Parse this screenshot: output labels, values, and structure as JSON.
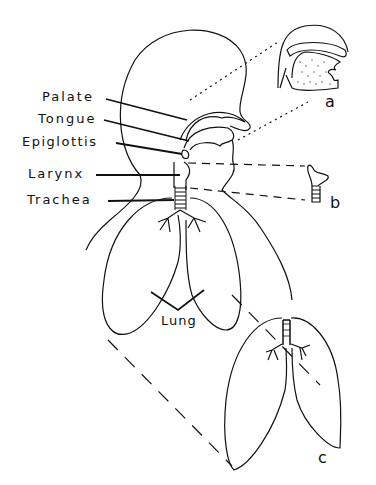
{
  "diagram": {
    "type": "anatomical illustration",
    "labels": {
      "palate": "Palate",
      "tongue": "Tongue",
      "epiglottis": "Epiglottis",
      "larynx": "Larynx",
      "trachea": "Trachea",
      "lung": "Lung"
    },
    "panels": {
      "a": "a",
      "b": "b",
      "c": "c"
    },
    "colors": {
      "line": "#111111",
      "background": "#ffffff"
    }
  }
}
